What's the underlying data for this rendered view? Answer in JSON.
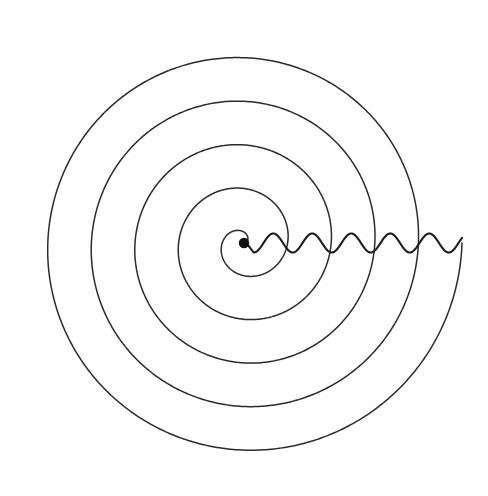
{
  "figure": {
    "background_color": "#fefefe",
    "width": 488,
    "height": 496
  },
  "center_marker": {
    "name": "origin-dot",
    "cx": 244,
    "cy": 243,
    "radius": 5.2,
    "color": "#111111"
  },
  "spiral": {
    "type": "archimedean",
    "stroke_color": "#2b2b2b",
    "stroke_width": 1.5,
    "center_x": 244,
    "center_y": 243,
    "turns": 5,
    "start_radius": 0,
    "radius_per_turn": 43.6,
    "max_radius": 218,
    "start_angle_deg": 0,
    "direction": "counterclockwise-visual",
    "right_axis_crossings_x": [
      287,
      303,
      342,
      380,
      420,
      462
    ],
    "left_axis_crossings_x": [
      203,
      161,
      117,
      76,
      29
    ],
    "top_axis_crossings_y": [
      203,
      150,
      118,
      72,
      22
    ],
    "bottom_axis_crossings_y": [
      285,
      337,
      371,
      417,
      470
    ]
  },
  "wave": {
    "name": "radial-sine-wave",
    "stroke_color": "#1c1c1c",
    "stroke_width": 2.1,
    "baseline_y": 243,
    "start_x": 244,
    "end_x": 462,
    "amplitude": 9.5,
    "wavelength": 39,
    "phase": "descending-from-origin",
    "cycles": 5.6
  },
  "chart_data": {
    "type": "line",
    "xlabel": "",
    "ylabel": "",
    "xlim": [
      0,
      488
    ],
    "ylim": [
      0,
      496
    ],
    "grid": false,
    "legend": "none",
    "series": [
      {
        "name": "spiral",
        "kind": "archimedean-spiral",
        "center": [
          244,
          243
        ],
        "turns": 5,
        "radius_per_turn": 43.6,
        "max_radius": 218,
        "radii_at_angle_0": [
          43.6,
          87.2,
          130.8,
          174.4,
          218.0
        ],
        "radii_at_angle_180": [
          41,
          83,
          127,
          168,
          215
        ]
      },
      {
        "name": "sine-wave",
        "kind": "sinusoid",
        "baseline_y": 243,
        "x_range": [
          244,
          462
        ],
        "amplitude": 9.5,
        "wavelength": 39,
        "peaks_x": [
          273,
          312,
          351,
          390,
          429
        ],
        "troughs_x": [
          254,
          293,
          332,
          371,
          410,
          449
        ]
      },
      {
        "name": "origin-marker",
        "kind": "point",
        "points": [
          [
            244,
            243
          ]
        ],
        "marker_radius": 5.2
      }
    ],
    "annotations": []
  }
}
